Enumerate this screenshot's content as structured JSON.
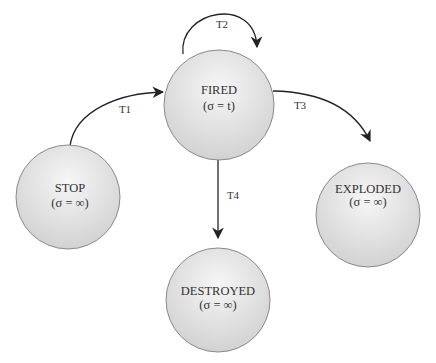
{
  "diagram": {
    "type": "state-machine",
    "colors": {
      "node_fill_light": "#f4f4f4",
      "node_fill_dark": "#cfcfcf",
      "node_stroke": "#8a8a8a",
      "edge": "#222222",
      "text": "#333333"
    },
    "nodes": [
      {
        "id": "fired",
        "name": "FIRED",
        "sub": "(σ = t)"
      },
      {
        "id": "stop",
        "name": "STOP",
        "sub": "(σ = ∞)"
      },
      {
        "id": "exploded",
        "name": "EXPLODED",
        "sub": "(σ = ∞)"
      },
      {
        "id": "destroyed",
        "name": "DESTROYED",
        "sub": "(σ = ∞)"
      }
    ],
    "edges": [
      {
        "id": "t1",
        "label": "T1",
        "from": "STOP",
        "to": "FIRED"
      },
      {
        "id": "t2",
        "label": "T2",
        "from": "FIRED",
        "to": "FIRED"
      },
      {
        "id": "t3",
        "label": "T3",
        "from": "FIRED",
        "to": "EXPLODED"
      },
      {
        "id": "t4",
        "label": "T4",
        "from": "FIRED",
        "to": "DESTROYED"
      }
    ]
  }
}
